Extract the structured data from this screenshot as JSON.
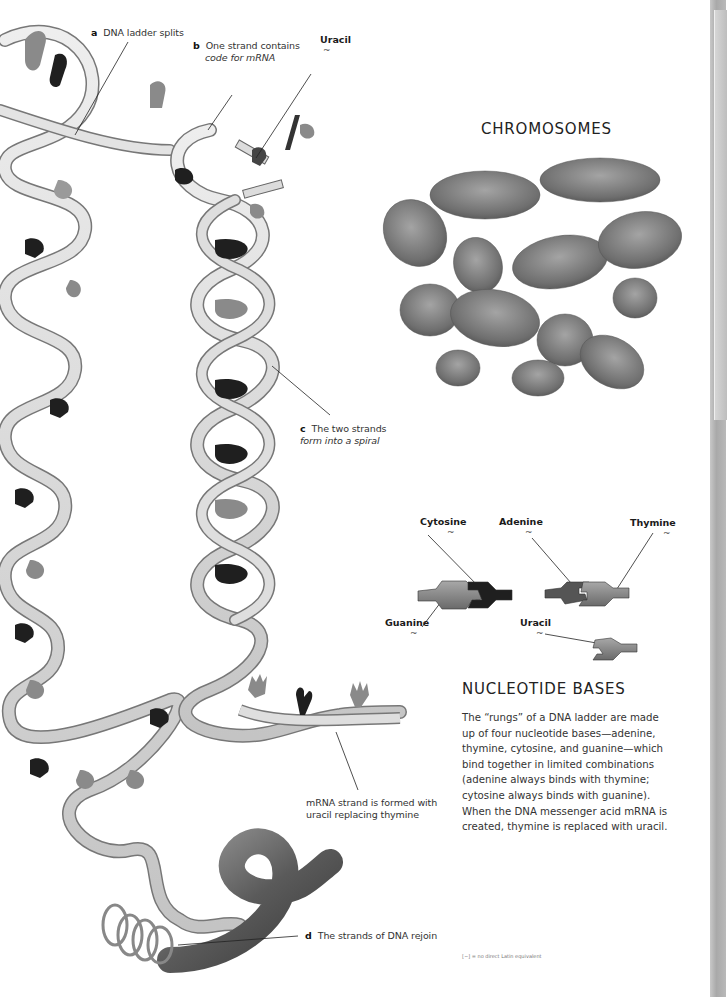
{
  "diagram": {
    "labels": {
      "a": {
        "letter": "a",
        "text": "DNA ladder splits"
      },
      "b": {
        "letter": "b",
        "text": "One strand contains",
        "text_italic": "code for mRNA"
      },
      "uracil_top": {
        "name": "Uracil",
        "latin": "~"
      },
      "c": {
        "letter": "c",
        "text": "The two strands",
        "text_italic": "form into a spiral"
      },
      "mrna": {
        "line1": "mRNA strand is formed with",
        "line2": "uracil replacing thymine"
      },
      "d": {
        "letter": "d",
        "text": "The strands of DNA rejoin"
      }
    }
  },
  "chromosomes": {
    "heading": "CHROMOSOMES"
  },
  "bases": {
    "cytosine": {
      "name": "Cytosine",
      "latin": "~"
    },
    "adenine": {
      "name": "Adenine",
      "latin": "~"
    },
    "thymine": {
      "name": "Thymine",
      "latin": "~"
    },
    "guanine": {
      "name": "Guanine",
      "latin": "~"
    },
    "uracil": {
      "name": "Uracil",
      "latin": "~"
    }
  },
  "nucleotide_section": {
    "heading": "NUCLEOTIDE BASES",
    "lines": [
      "The “rungs” of a DNA ladder are made",
      "up of four nucleotide bases—adenine,",
      "thymine, cytosine, and guanine—which",
      "bind together in limited combinations",
      "(adenine always binds with thymine;",
      "cytosine always binds with guanine).",
      "When the DNA messenger acid mRNA is",
      "created, thymine is replaced with uracil."
    ]
  },
  "footnote": "[~] = no direct Latin equivalent",
  "colors": {
    "ribbon": "#d9d9d9",
    "ribbon_edge": "#6e6e6e",
    "base_dark": "#1f1f1f",
    "base_mid": "#8a8a8a",
    "chromosome": "#7d7d7d",
    "page_edge": "#b0b0b0"
  }
}
